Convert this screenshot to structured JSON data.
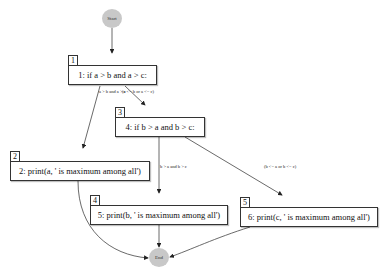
{
  "diagram": {
    "type": "control-flow-graph",
    "start": {
      "label": "Start"
    },
    "end": {
      "label": "End"
    },
    "nodes": [
      {
        "id": "1",
        "text": "1: if a > b and a > c:"
      },
      {
        "id": "2",
        "text": "2: print(a, ' is maximum among all')"
      },
      {
        "id": "3",
        "text": "4: if b > a and b > c:"
      },
      {
        "id": "4",
        "text": "5: print(b, ' is maximum among all')"
      },
      {
        "id": "5",
        "text": "6: print(c, ' is maximum among all')"
      }
    ],
    "edges": [
      {
        "from": "Start",
        "to": "1",
        "label": ""
      },
      {
        "from": "1",
        "to": "2",
        "label": "a > b and a > c"
      },
      {
        "from": "1",
        "to": "3",
        "label": "(a <= b or a <= c)"
      },
      {
        "from": "3",
        "to": "4",
        "label": "b > a and b > c"
      },
      {
        "from": "3",
        "to": "5",
        "label": "(b <= a or b <= c)"
      },
      {
        "from": "2",
        "to": "End",
        "label": ""
      },
      {
        "from": "4",
        "to": "End",
        "label": ""
      },
      {
        "from": "5",
        "to": "End",
        "label": ""
      }
    ],
    "colors": {
      "terminal_fill": "#c8c8c8",
      "box_border": "#333333",
      "edge": "#333333"
    }
  }
}
